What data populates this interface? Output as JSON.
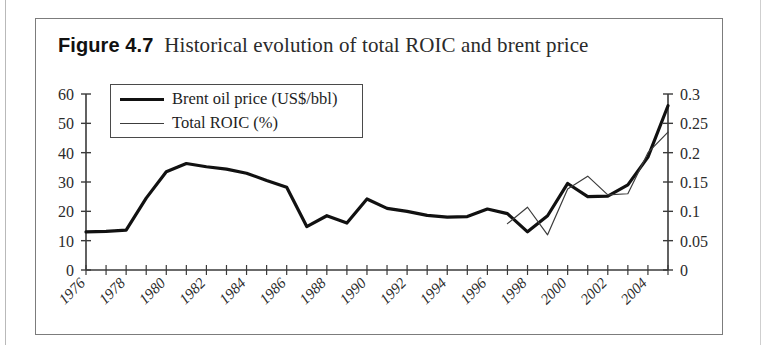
{
  "figure": {
    "label": "Figure 4.7",
    "caption": "Historical evolution of total ROIC and brent price"
  },
  "legend": {
    "items": [
      {
        "label": "Brent oil price (US$/bbl)",
        "style": "thick"
      },
      {
        "label": "Total ROIC (%)",
        "style": "thin"
      }
    ]
  },
  "chart_data": {
    "type": "line",
    "title": "Historical evolution of total ROIC and brent price",
    "xlabel": "",
    "ylabel": "",
    "grid": false,
    "legend_position": "top-left-inside",
    "x": [
      1976,
      1977,
      1978,
      1979,
      1980,
      1981,
      1982,
      1983,
      1984,
      1985,
      1986,
      1987,
      1988,
      1989,
      1990,
      1991,
      1992,
      1993,
      1994,
      1995,
      1996,
      1997,
      1998,
      1999,
      2000,
      2001,
      2002,
      2003,
      2004,
      2005
    ],
    "x_tick_labels": [
      "1976",
      "1978",
      "1980",
      "1982",
      "1984",
      "1986",
      "1988",
      "1990",
      "1992",
      "1994",
      "1996",
      "1998",
      "2000",
      "2002",
      "2004"
    ],
    "x_tick_label_step_years": 2,
    "x_minor_tick_step_years": 1,
    "axes": {
      "left": {
        "label": "Brent oil price (US$/bbl)",
        "ticks": [
          0,
          10,
          20,
          30,
          40,
          50,
          60
        ],
        "tick_labels": [
          "0",
          "10",
          "20",
          "30",
          "40",
          "50",
          "60"
        ],
        "ylim": [
          0,
          60
        ]
      },
      "right": {
        "label": "Total ROIC (%)",
        "ticks": [
          0,
          0.05,
          0.1,
          0.15,
          0.2,
          0.25,
          0.3
        ],
        "tick_labels": [
          "0",
          "0.05",
          "0.1",
          "0.15",
          "0.2",
          "0.25",
          "0.3"
        ],
        "ylim": [
          0,
          0.3
        ]
      }
    },
    "series": [
      {
        "name": "Brent oil price (US$/bbl)",
        "axis": "left",
        "style": "thick",
        "color": "#111111",
        "x": [
          1976,
          1977,
          1978,
          1979,
          1980,
          1981,
          1982,
          1983,
          1984,
          1985,
          1986,
          1987,
          1988,
          1989,
          1990,
          1991,
          1992,
          1993,
          1994,
          1995,
          1996,
          1997,
          1998,
          1999,
          2000,
          2001,
          2002,
          2003,
          2004,
          2005
        ],
        "values": [
          13.0,
          13.2,
          13.6,
          24.5,
          33.5,
          36.3,
          35.2,
          34.4,
          33.0,
          30.5,
          28.2,
          14.8,
          18.5,
          16.0,
          24.2,
          21.0,
          20.0,
          18.6,
          18.0,
          18.2,
          20.8,
          19.2,
          13.0,
          18.5,
          29.5,
          25.0,
          25.2,
          29.0,
          38.5,
          56.0
        ]
      },
      {
        "name": "Total ROIC (%)",
        "axis": "right",
        "style": "thin",
        "color": "#3c3c3c",
        "x": [
          1997,
          1998,
          1999,
          2000,
          2001,
          2002,
          2003,
          2004,
          2005
        ],
        "values": [
          0.079,
          0.107,
          0.06,
          0.138,
          0.16,
          0.128,
          0.13,
          0.2,
          0.235
        ]
      }
    ]
  }
}
